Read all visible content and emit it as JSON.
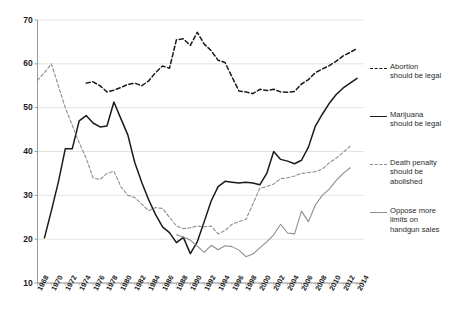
{
  "chart_data": {
    "type": "line",
    "title": "",
    "subtitle": "",
    "xlabel": "",
    "ylabel": "",
    "xlim": [
      1968,
      2015
    ],
    "ylim": [
      10,
      70
    ],
    "yticks": [
      10,
      20,
      30,
      40,
      50,
      60,
      70
    ],
    "xticks": [
      1968,
      1970,
      1972,
      1974,
      1976,
      1978,
      1980,
      1982,
      1984,
      1986,
      1988,
      1990,
      1992,
      1994,
      1996,
      1998,
      2000,
      2002,
      2004,
      2006,
      2008,
      2010,
      2012,
      2014
    ],
    "grid": "horizontal",
    "legend_position": "right",
    "series": [
      {
        "name": "abortion",
        "legend_line1": "Abortion",
        "legend_line2": "should be legal",
        "style": "dashed",
        "color": "#1a1a1a",
        "x": [
          1975,
          1976,
          1977,
          1978,
          1979,
          1980,
          1981,
          1982,
          1983,
          1984,
          1985,
          1986,
          1987,
          1988,
          1989,
          1990,
          1991,
          1992,
          1993,
          1994,
          1995,
          1996,
          1997,
          1998,
          1999,
          2000,
          2001,
          2002,
          2003,
          2004,
          2005,
          2006,
          2007,
          2008,
          2009,
          2010,
          2011,
          2012,
          2013,
          2014
        ],
        "values": [
          55.6,
          55.9,
          55.0,
          53.6,
          54.0,
          54.6,
          55.3,
          55.6,
          55.0,
          56.1,
          58.0,
          59.5,
          59.0,
          65.5,
          65.7,
          64.2,
          67.2,
          64.5,
          63.0,
          60.8,
          60.3,
          57.0,
          53.8,
          53.6,
          53.2,
          54.2,
          53.9,
          54.2,
          53.6,
          53.5,
          53.7,
          55.4,
          56.4,
          58.0,
          58.8,
          59.6,
          60.6,
          61.8,
          62.6,
          63.5
        ]
      },
      {
        "name": "marijuana",
        "legend_line1": "Marijuana",
        "legend_line2": "should be legal",
        "style": "solid",
        "color": "#1a1a1a",
        "x": [
          1969,
          1970,
          1971,
          1972,
          1973,
          1974,
          1975,
          1976,
          1977,
          1978,
          1979,
          1980,
          1981,
          1982,
          1983,
          1984,
          1985,
          1986,
          1987,
          1988,
          1989,
          1990,
          1991,
          1992,
          1993,
          1994,
          1995,
          1996,
          1997,
          1998,
          1999,
          2000,
          2001,
          2002,
          2003,
          2004,
          2005,
          2006,
          2007,
          2008,
          2009,
          2010,
          2011,
          2012,
          2013,
          2014
        ],
        "values": [
          20.3,
          26.5,
          33.0,
          40.6,
          40.6,
          47.0,
          48.2,
          46.5,
          45.6,
          45.8,
          51.3,
          47.5,
          43.8,
          37.5,
          33.0,
          29.0,
          25.6,
          22.8,
          21.5,
          19.2,
          20.4,
          16.7,
          19.4,
          24.0,
          28.7,
          32.0,
          33.2,
          33.0,
          32.8,
          33.0,
          32.8,
          32.4,
          35.0,
          40.0,
          38.2,
          37.8,
          37.2,
          38.0,
          41.0,
          45.8,
          48.5,
          51.0,
          53.0,
          54.5,
          55.6,
          56.7
        ]
      },
      {
        "name": "death_penalty",
        "legend_line1": "Death penalty",
        "legend_line2": "should be",
        "legend_line3": "abolished",
        "style": "dashed",
        "color": "#8d8d8d",
        "x": [
          1968,
          1969,
          1970,
          1971,
          1972,
          1973,
          1974,
          1975,
          1976,
          1977,
          1978,
          1979,
          1980,
          1981,
          1982,
          1983,
          1984,
          1985,
          1986,
          1987,
          1988,
          1989,
          1990,
          1991,
          1992,
          1993,
          1994,
          1995,
          1996,
          1997,
          1998,
          1999,
          2000,
          2001,
          2002,
          2003,
          2004,
          2005,
          2006,
          2007,
          2008,
          2009,
          2010,
          2011,
          2012,
          2013
        ],
        "values": [
          56.2,
          58.0,
          60.0,
          55.0,
          50.0,
          46.0,
          42.0,
          38.5,
          34.0,
          33.6,
          35.0,
          35.5,
          32.0,
          30.0,
          29.5,
          28.0,
          26.5,
          27.2,
          27.0,
          25.0,
          23.0,
          22.4,
          22.6,
          23.0,
          22.8,
          23.0,
          21.2,
          22.0,
          23.4,
          24.0,
          24.5,
          28.0,
          31.6,
          32.0,
          32.6,
          33.8,
          34.0,
          34.4,
          35.0,
          35.2,
          35.4,
          36.0,
          37.4,
          38.5,
          39.8,
          41.2
        ]
      },
      {
        "name": "handgun",
        "legend_line1": "Oppose more",
        "legend_line2": "limits on",
        "legend_line3": "handgun sales",
        "style": "solid",
        "color": "#8d8d8d",
        "x": [
          1988,
          1989,
          1990,
          1991,
          1992,
          1993,
          1994,
          1995,
          1996,
          1997,
          1998,
          1999,
          2000,
          2001,
          2002,
          2003,
          2004,
          2005,
          2006,
          2007,
          2008,
          2009,
          2010,
          2011,
          2012,
          2013
        ],
        "values": [
          21.0,
          20.5,
          19.8,
          18.4,
          17.0,
          18.6,
          17.6,
          18.5,
          18.3,
          17.5,
          16.0,
          16.6,
          18.0,
          19.4,
          21.0,
          23.4,
          21.4,
          21.2,
          26.4,
          24.0,
          27.8,
          30.0,
          31.4,
          33.4,
          35.0,
          36.3
        ]
      }
    ]
  },
  "axis": {
    "y_labels": [
      "70",
      "60",
      "50",
      "40",
      "30",
      "20",
      "10"
    ],
    "x_labels": [
      "1968",
      "1970",
      "1972",
      "1974",
      "1976",
      "1978",
      "1980",
      "1982",
      "1984",
      "1986",
      "1988",
      "1990",
      "1992",
      "1994",
      "1996",
      "1998",
      "2000",
      "2002",
      "2004",
      "2006",
      "2008",
      "2010",
      "2012",
      "2014"
    ]
  },
  "legend": {
    "items": [
      {
        "id": "abortion",
        "lines": [
          "Abortion",
          "should be legal"
        ]
      },
      {
        "id": "marijuana",
        "lines": [
          "Marijuana",
          "should be legal"
        ]
      },
      {
        "id": "death-penalty",
        "lines": [
          "Death penalty",
          "should be",
          "abolished"
        ]
      },
      {
        "id": "handgun",
        "lines": [
          "Oppose more",
          "limits on",
          "handgun sales"
        ]
      }
    ]
  },
  "colors": {
    "dark": "#1a1a1a",
    "gray": "#8d8d8d",
    "grid": "#dcdcdc",
    "axis": "#9a9a9a",
    "background": "#ffffff"
  }
}
